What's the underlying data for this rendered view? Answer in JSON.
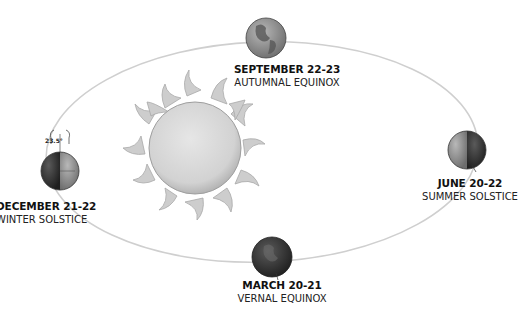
{
  "diagram": {
    "sun": {
      "label": ""
    },
    "tilt_label": "23.5°",
    "positions": [
      {
        "id": "september",
        "date": "SEPTEMBER 22-23",
        "event": "AUTUMNAL EQUINOX"
      },
      {
        "id": "december",
        "date": "DECEMBER 21-22",
        "event": "WINTER SOLSTICE"
      },
      {
        "id": "june",
        "date": "JUNE 20-22",
        "event": "SUMMER SOLSTICE"
      },
      {
        "id": "march",
        "date": "MARCH 20-21",
        "event": "VERNAL EQUINOX"
      }
    ]
  },
  "colors": {
    "orbit": "#c8c8c8",
    "sun_disk": "#d9d9d9",
    "sun_flames": "#c4c4c4",
    "earth_light": "#9a9a9a",
    "earth_dark": "#3a3a3a"
  }
}
